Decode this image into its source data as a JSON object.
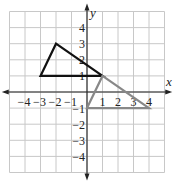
{
  "chart_data": {
    "type": "line",
    "title": "",
    "xlabel": "x",
    "ylabel": "y",
    "xlim": [
      -5,
      5
    ],
    "ylim": [
      -5,
      5
    ],
    "grid": true,
    "x_ticks": [
      "-4",
      "-3",
      "-2",
      "-1",
      "1",
      "2",
      "3",
      "4"
    ],
    "y_ticks": [
      "4",
      "3",
      "2",
      "1",
      "-1",
      "-2",
      "-3",
      "-4"
    ],
    "series": [
      {
        "name": "original triangle",
        "color": "#111111",
        "points": [
          [
            -3,
            1
          ],
          [
            -2,
            3
          ],
          [
            1,
            1
          ]
        ]
      },
      {
        "name": "transformed triangle",
        "color": "#888888",
        "points": [
          [
            0,
            -1
          ],
          [
            1,
            1
          ],
          [
            4,
            -1
          ]
        ]
      }
    ]
  },
  "colors": {
    "grid": "#c8c8c8",
    "axis": "#222222",
    "black_triangle": "#111111",
    "gray_triangle": "#888888"
  }
}
